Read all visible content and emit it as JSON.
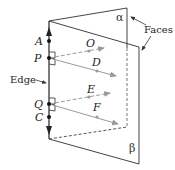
{
  "diagram": {
    "points": {
      "A": "A",
      "P": "P",
      "Q": "Q",
      "C": "C",
      "O": "O",
      "D": "D",
      "E": "E",
      "F": "F"
    },
    "planes": {
      "back": "α",
      "front": "β"
    },
    "callouts": {
      "edge": "Edge",
      "faces": "Faces"
    },
    "colors": {
      "line": "#333333",
      "ray": "#9a9a9a",
      "text": "#222222"
    }
  }
}
